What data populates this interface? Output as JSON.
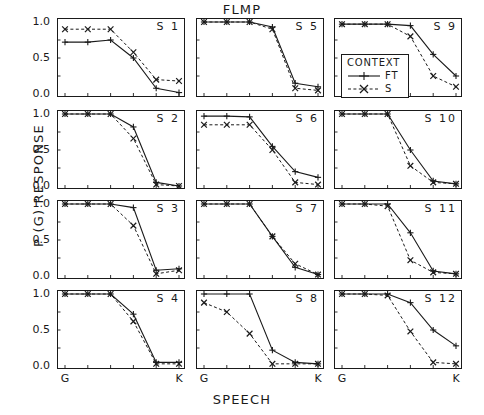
{
  "figure": {
    "title": "FLMP",
    "x_axis_title": "SPEECH",
    "y_axis_title": "P (G) RESPONSE"
  },
  "legend": {
    "title": "CONTEXT",
    "entries": [
      {
        "label": "FT",
        "style": "solid-line-plus-marker",
        "marker": "plus",
        "dash": "none"
      },
      {
        "label": "S",
        "style": "dashed-line-cross-marker",
        "marker": "cross",
        "dash": "dashed"
      }
    ]
  },
  "axes": {
    "y_ticks": [
      "1.0",
      "0.5",
      "0.0"
    ],
    "x_ticks": [
      "G",
      "",
      "",
      "",
      "",
      "K"
    ]
  },
  "chart_data": {
    "type": "line",
    "title": "FLMP",
    "xlabel": "SPEECH",
    "ylabel": "P (G) RESPONSE",
    "ylim": [
      0.0,
      1.0
    ],
    "xlim": [
      1,
      6
    ],
    "grid": false,
    "legend_position": "top-right-panel-s9",
    "legend_title": "CONTEXT",
    "x": [
      1,
      2,
      3,
      4,
      5,
      6
    ],
    "x_tick_labels": [
      "G",
      "",
      "",
      "",
      "",
      "K"
    ],
    "panels": [
      {
        "label": "S  1",
        "subject": 1,
        "row": 1,
        "col": 1,
        "series": [
          {
            "name": "FT",
            "values": [
              0.72,
              0.72,
              0.75,
              0.5,
              0.08,
              0.02
            ]
          },
          {
            "name": "S",
            "values": [
              0.9,
              0.9,
              0.9,
              0.58,
              0.2,
              0.18
            ]
          }
        ]
      },
      {
        "label": "S  2",
        "subject": 2,
        "row": 2,
        "col": 1,
        "series": [
          {
            "name": "FT",
            "values": [
              1.0,
              1.0,
              1.0,
              0.82,
              0.05,
              0.0
            ]
          },
          {
            "name": "S",
            "values": [
              1.0,
              1.0,
              1.0,
              0.66,
              0.02,
              0.0
            ]
          }
        ]
      },
      {
        "label": "S  3",
        "subject": 3,
        "row": 3,
        "col": 1,
        "series": [
          {
            "name": "FT",
            "values": [
              1.0,
              1.0,
              1.0,
              0.95,
              0.08,
              0.1
            ]
          },
          {
            "name": "S",
            "values": [
              1.0,
              1.0,
              1.0,
              0.7,
              0.03,
              0.08
            ]
          }
        ]
      },
      {
        "label": "S  4",
        "subject": 4,
        "row": 4,
        "col": 1,
        "series": [
          {
            "name": "FT",
            "values": [
              1.0,
              1.0,
              1.0,
              0.72,
              0.05,
              0.05
            ]
          },
          {
            "name": "S",
            "values": [
              1.0,
              1.0,
              1.0,
              0.62,
              0.03,
              0.03
            ]
          }
        ]
      },
      {
        "label": "S  5",
        "subject": 5,
        "row": 1,
        "col": 2,
        "series": [
          {
            "name": "FT",
            "values": [
              1.0,
              1.0,
              1.0,
              0.93,
              0.15,
              0.1
            ]
          },
          {
            "name": "S",
            "values": [
              1.0,
              1.0,
              1.0,
              0.9,
              0.08,
              0.05
            ]
          }
        ]
      },
      {
        "label": "S  6",
        "subject": 6,
        "row": 2,
        "col": 2,
        "series": [
          {
            "name": "FT",
            "values": [
              0.97,
              0.97,
              0.96,
              0.55,
              0.2,
              0.12
            ]
          },
          {
            "name": "S",
            "values": [
              0.85,
              0.85,
              0.85,
              0.5,
              0.05,
              0.02
            ]
          }
        ]
      },
      {
        "label": "S  7",
        "subject": 7,
        "row": 3,
        "col": 2,
        "series": [
          {
            "name": "FT",
            "values": [
              1.0,
              1.0,
              1.0,
              0.55,
              0.12,
              0.02
            ]
          },
          {
            "name": "S",
            "values": [
              1.0,
              1.0,
              1.0,
              0.55,
              0.17,
              0.02
            ]
          }
        ]
      },
      {
        "label": "S  8",
        "subject": 8,
        "row": 4,
        "col": 2,
        "series": [
          {
            "name": "FT",
            "values": [
              1.0,
              1.0,
              1.0,
              0.22,
              0.05,
              0.03
            ]
          },
          {
            "name": "S",
            "values": [
              0.88,
              0.75,
              0.45,
              0.03,
              0.03,
              0.03
            ]
          }
        ]
      },
      {
        "label": "S  9",
        "subject": 9,
        "row": 1,
        "col": 3,
        "series": [
          {
            "name": "FT",
            "values": [
              0.97,
              0.97,
              0.97,
              0.95,
              0.55,
              0.25
            ]
          },
          {
            "name": "S",
            "values": [
              0.97,
              0.97,
              0.97,
              0.8,
              0.25,
              0.1
            ]
          }
        ]
      },
      {
        "label": "S 10",
        "subject": 10,
        "row": 2,
        "col": 3,
        "series": [
          {
            "name": "FT",
            "values": [
              1.0,
              1.0,
              1.0,
              0.5,
              0.07,
              0.03
            ]
          },
          {
            "name": "S",
            "values": [
              1.0,
              1.0,
              1.0,
              0.28,
              0.05,
              0.03
            ]
          }
        ]
      },
      {
        "label": "S 11",
        "subject": 11,
        "row": 3,
        "col": 3,
        "series": [
          {
            "name": "FT",
            "values": [
              1.0,
              1.0,
              1.0,
              0.6,
              0.07,
              0.03
            ]
          },
          {
            "name": "S",
            "values": [
              1.0,
              1.0,
              0.97,
              0.22,
              0.05,
              0.03
            ]
          }
        ]
      },
      {
        "label": "S 12",
        "subject": 12,
        "row": 4,
        "col": 3,
        "series": [
          {
            "name": "FT",
            "values": [
              1.0,
              1.0,
              1.0,
              0.88,
              0.5,
              0.28
            ]
          },
          {
            "name": "S",
            "values": [
              1.0,
              1.0,
              0.98,
              0.48,
              0.05,
              0.03
            ]
          }
        ]
      }
    ]
  }
}
